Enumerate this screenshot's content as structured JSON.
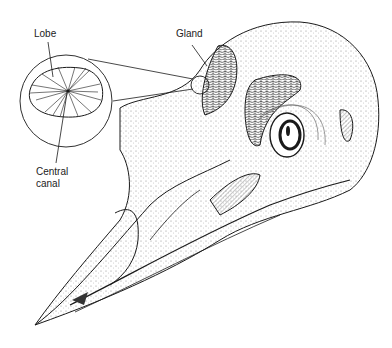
{
  "figure": {
    "labels": {
      "lobe": "Lobe",
      "gland": "Gland",
      "central_canal_line1": "Central",
      "central_canal_line2": "canal"
    },
    "colors": {
      "ink": "#1a1a1a",
      "background": "#ffffff",
      "stipple": "#888888"
    }
  }
}
